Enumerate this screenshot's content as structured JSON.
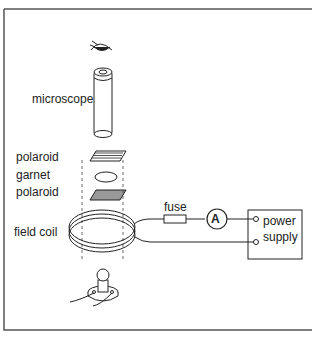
{
  "labels": {
    "microscope": "microscope",
    "polaroid_top": "polaroid",
    "garnet": "garnet",
    "polaroid_bottom": "polaroid",
    "field_coil": "field coil",
    "fuse": "fuse",
    "ammeter": "A",
    "power_supply_line1": "power",
    "power_supply_line2": "supply"
  }
}
